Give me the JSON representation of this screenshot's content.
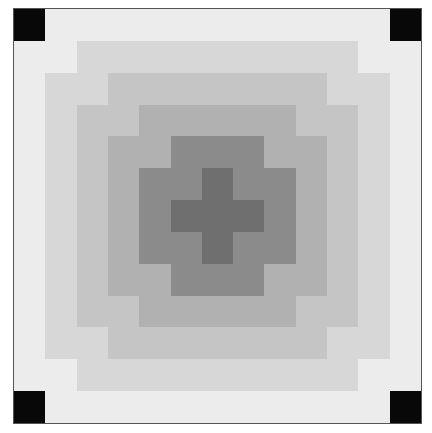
{
  "board": {
    "rows": 13,
    "cols": 13,
    "palette": {
      "B": "#080808",
      "W": "#ececec",
      "4": "#d7d7d7",
      "3": "#c5c5c5",
      "2": "#b1b1b1",
      "1": "#8b8b8b",
      "0": "#6f6f6f"
    },
    "grid": [
      [
        "B",
        "W",
        "W",
        "W",
        "W",
        "W",
        "W",
        "W",
        "W",
        "W",
        "W",
        "W",
        "B"
      ],
      [
        "W",
        "W",
        "4",
        "4",
        "4",
        "4",
        "4",
        "4",
        "4",
        "4",
        "4",
        "W",
        "W"
      ],
      [
        "W",
        "4",
        "4",
        "3",
        "3",
        "3",
        "3",
        "3",
        "3",
        "3",
        "4",
        "4",
        "W"
      ],
      [
        "W",
        "4",
        "3",
        "3",
        "2",
        "2",
        "2",
        "2",
        "2",
        "3",
        "3",
        "4",
        "W"
      ],
      [
        "W",
        "4",
        "3",
        "2",
        "2",
        "1",
        "1",
        "1",
        "2",
        "2",
        "3",
        "4",
        "W"
      ],
      [
        "W",
        "4",
        "3",
        "2",
        "1",
        "1",
        "0",
        "1",
        "1",
        "2",
        "3",
        "4",
        "W"
      ],
      [
        "W",
        "4",
        "3",
        "2",
        "1",
        "0",
        "0",
        "0",
        "1",
        "2",
        "3",
        "4",
        "W"
      ],
      [
        "W",
        "4",
        "3",
        "2",
        "1",
        "1",
        "0",
        "1",
        "1",
        "2",
        "3",
        "4",
        "W"
      ],
      [
        "W",
        "4",
        "3",
        "2",
        "2",
        "1",
        "1",
        "1",
        "2",
        "2",
        "3",
        "4",
        "W"
      ],
      [
        "W",
        "4",
        "3",
        "3",
        "2",
        "2",
        "2",
        "2",
        "2",
        "3",
        "3",
        "4",
        "W"
      ],
      [
        "W",
        "4",
        "4",
        "3",
        "3",
        "3",
        "3",
        "3",
        "3",
        "3",
        "4",
        "4",
        "W"
      ],
      [
        "W",
        "W",
        "4",
        "4",
        "4",
        "4",
        "4",
        "4",
        "4",
        "4",
        "4",
        "W",
        "W"
      ],
      [
        "B",
        "W",
        "W",
        "W",
        "W",
        "W",
        "W",
        "W",
        "W",
        "W",
        "W",
        "W",
        "B"
      ]
    ]
  }
}
